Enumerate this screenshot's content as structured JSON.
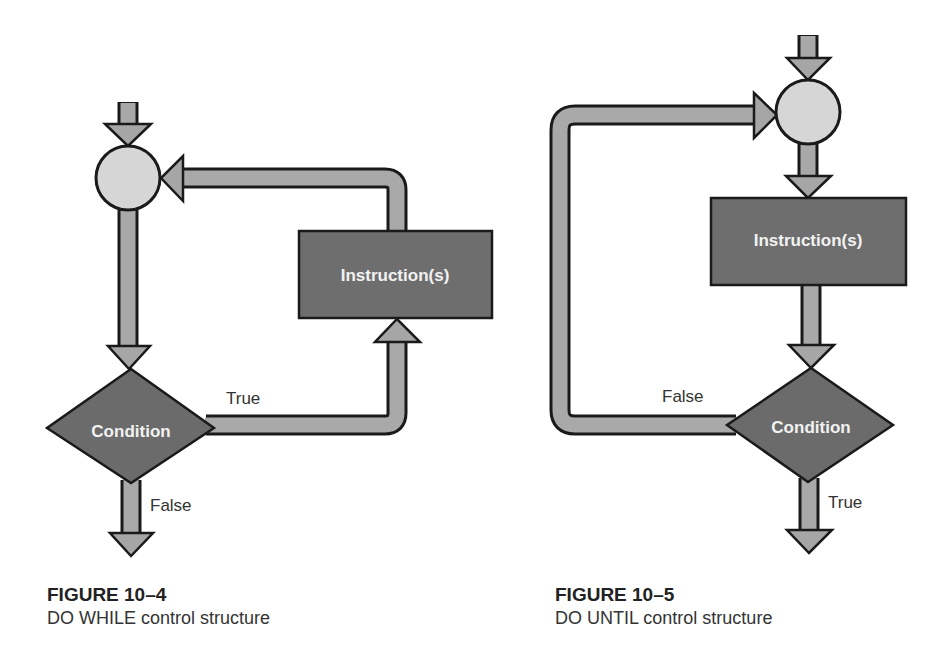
{
  "figures": [
    {
      "id": "fig-10-4",
      "caption_number": "FIGURE 10–4",
      "caption_text": "DO WHILE control structure",
      "nodes": {
        "junction": "",
        "process": "Instruction(s)",
        "decision": "Condition"
      },
      "edges": {
        "true_label": "True",
        "false_label": "False"
      }
    },
    {
      "id": "fig-10-5",
      "caption_number": "FIGURE 10–5",
      "caption_text": "DO UNTIL control structure",
      "nodes": {
        "junction": "",
        "process": "Instruction(s)",
        "decision": "Condition"
      },
      "edges": {
        "false_label": "False",
        "true_label": "True"
      }
    }
  ],
  "colors": {
    "pipe_fill": "#a9a9a9",
    "outline": "#1a1a1a",
    "junction_fill": "#d6d6d6",
    "box_fill": "#6e6e6e",
    "label_text": "#f2f2f2"
  }
}
